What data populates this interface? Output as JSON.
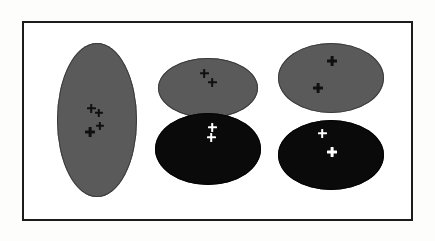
{
  "figure": {
    "width": 435,
    "height": 241,
    "background_color": "#fdfdfb",
    "inner_background_color": "#ffffff",
    "frame": {
      "name": "figure-border",
      "x": 22,
      "y": 21,
      "width": 391,
      "height": 200,
      "stroke_color": "#1c1c1c",
      "stroke_width": 2
    }
  },
  "palette": {
    "gray_fill": "#5a5a5a",
    "gray_stroke": "#3c3c3c",
    "black_fill": "#0a0a0a",
    "black_stroke": "#050505",
    "marker_dark": "#101010",
    "marker_light": "#ffffff"
  },
  "diagram": {
    "type": "cluster-ellipse-diagram",
    "group_count": 3,
    "groups": [
      {
        "name": "group-left",
        "label": "",
        "shapes": [
          {
            "name": "ellipse-left-gray",
            "fill": "gray",
            "cx": 97,
            "cy": 120,
            "rx": 40,
            "ry": 77,
            "clipped_bottom": false,
            "markers": [
              {
                "name": "marker-plus",
                "cx": 91,
                "cy": 108,
                "size": 9,
                "thickness": 2.6,
                "color": "dark"
              },
              {
                "name": "marker-plus",
                "cx": 99,
                "cy": 113,
                "size": 8,
                "thickness": 2.4,
                "color": "dark"
              },
              {
                "name": "marker-plus",
                "cx": 90,
                "cy": 132,
                "size": 10,
                "thickness": 2.8,
                "color": "dark"
              },
              {
                "name": "marker-plus",
                "cx": 100,
                "cy": 126,
                "size": 8,
                "thickness": 2.3,
                "color": "dark"
              }
            ]
          }
        ]
      },
      {
        "name": "group-middle",
        "label": "",
        "shapes": [
          {
            "name": "ellipse-middle-gray",
            "fill": "gray",
            "cx": 208,
            "cy": 88,
            "rx": 50,
            "ry": 30,
            "clipped_bottom": true,
            "markers": [
              {
                "name": "marker-plus",
                "cx": 204,
                "cy": 73,
                "size": 9,
                "thickness": 2.7,
                "color": "dark"
              },
              {
                "name": "marker-plus",
                "cx": 212,
                "cy": 82,
                "size": 9,
                "thickness": 2.7,
                "color": "dark"
              }
            ]
          },
          {
            "name": "ellipse-middle-black",
            "fill": "black",
            "cx": 208,
            "cy": 149,
            "rx": 53,
            "ry": 36,
            "clipped_bottom": false,
            "markers": [
              {
                "name": "marker-plus",
                "cx": 212,
                "cy": 127,
                "size": 9,
                "thickness": 2.6,
                "color": "light"
              },
              {
                "name": "marker-plus",
                "cx": 211,
                "cy": 137,
                "size": 9,
                "thickness": 2.6,
                "color": "light"
              }
            ]
          }
        ]
      },
      {
        "name": "group-right",
        "label": "",
        "shapes": [
          {
            "name": "ellipse-right-gray",
            "fill": "gray",
            "cx": 331,
            "cy": 78,
            "rx": 53,
            "ry": 35,
            "clipped_bottom": false,
            "markers": [
              {
                "name": "marker-plus",
                "cx": 332,
                "cy": 61,
                "size": 10,
                "thickness": 2.8,
                "color": "dark"
              },
              {
                "name": "marker-plus",
                "cx": 318,
                "cy": 88,
                "size": 10,
                "thickness": 2.8,
                "color": "dark"
              }
            ]
          },
          {
            "name": "ellipse-right-black",
            "fill": "black",
            "cx": 331,
            "cy": 155,
            "rx": 53,
            "ry": 35,
            "clipped_bottom": false,
            "markers": [
              {
                "name": "marker-plus",
                "cx": 322,
                "cy": 133,
                "size": 9,
                "thickness": 2.6,
                "color": "light"
              },
              {
                "name": "marker-plus",
                "cx": 332,
                "cy": 152,
                "size": 10,
                "thickness": 2.8,
                "color": "light"
              }
            ]
          }
        ]
      }
    ]
  }
}
